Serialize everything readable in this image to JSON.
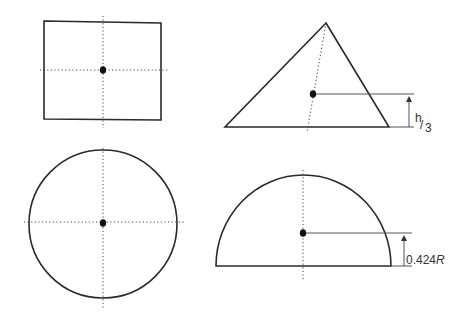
{
  "diagram": {
    "shapes": [
      {
        "name": "square",
        "centroid_note": "center"
      },
      {
        "name": "triangle",
        "dimension_label": {
          "num": "h",
          "den": "3"
        }
      },
      {
        "name": "circle",
        "centroid_note": "center"
      },
      {
        "name": "semicircle",
        "dimension_label": {
          "value": "0.424",
          "var": "R"
        }
      }
    ]
  },
  "labels": {
    "triangle_h": "h",
    "triangle_slash": "/",
    "triangle_den": "3",
    "semicircle_value": "0.424",
    "semicircle_var": "R"
  },
  "colors": {
    "stroke": "#2a2a2a",
    "dot": "#111111",
    "background": "#ffffff"
  }
}
